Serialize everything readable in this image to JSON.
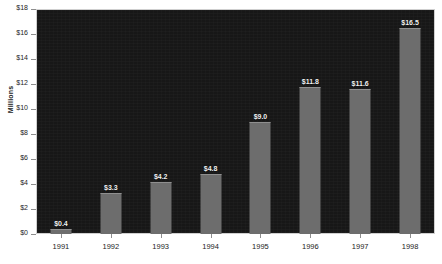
{
  "chart_data": {
    "type": "bar",
    "title": "",
    "xlabel": "",
    "ylabel": "Millions",
    "categories": [
      "1991",
      "1992",
      "1993",
      "1994",
      "1995",
      "1996",
      "1997",
      "1998"
    ],
    "values": [
      0.4,
      3.3,
      4.2,
      4.8,
      9.0,
      11.8,
      11.6,
      16.5
    ],
    "data_labels": [
      "$0.4",
      "$3.3",
      "$4.2",
      "$4.8",
      "$9.0",
      "$11.8",
      "$11.6",
      "$16.5"
    ],
    "ylim": [
      0,
      18
    ],
    "ytick_values": [
      18,
      16,
      14,
      12,
      10,
      8,
      6,
      4,
      2,
      0
    ],
    "ytick_labels": [
      "$18",
      "$16",
      "$14",
      "$12",
      "$10",
      "$8",
      "$6",
      "$4",
      "$2",
      "$0"
    ],
    "grid": false,
    "legend": null,
    "colors": {
      "plot_background": "#171717",
      "bar_fill": "#6d6d6d",
      "bar_top_highlight": "#8f8f8f",
      "page_background": "#ffffff",
      "axis_text": "#1c1c1c",
      "data_label_text": "#f2f2f2",
      "tick_mark": "#8d8d8d",
      "plot_border": "#cfcfcf"
    }
  }
}
